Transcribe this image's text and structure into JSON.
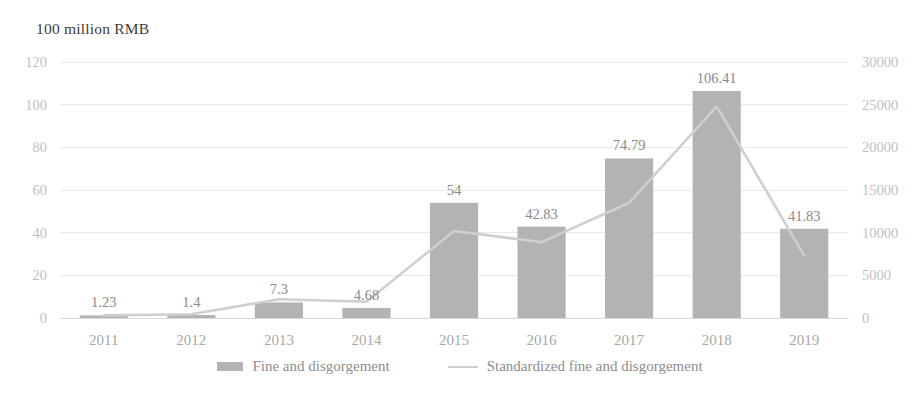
{
  "chart_data": {
    "type": "bar",
    "title": "",
    "ylabel": "100 million RMB",
    "xlabel": "",
    "categories": [
      "2011",
      "2012",
      "2013",
      "2014",
      "2015",
      "2016",
      "2017",
      "2018",
      "2019"
    ],
    "grid": true,
    "legend_position": "bottom",
    "ylim": [
      0,
      120
    ],
    "y2lim": [
      0,
      30000
    ],
    "yticks": [
      "0",
      "20",
      "40",
      "60",
      "80",
      "100",
      "120"
    ],
    "y2ticks": [
      "0",
      "5000",
      "10000",
      "15000",
      "20000",
      "25000",
      "30000"
    ],
    "series": [
      {
        "name": "Fine and disgorgement",
        "type": "bar",
        "axis": "left",
        "color": "#b3b3b3",
        "values": [
          1.23,
          1.4,
          7.3,
          4.68,
          54,
          42.83,
          74.79,
          106.41,
          41.83
        ],
        "data_labels": [
          "1.23",
          "1.4",
          "7.3",
          "4.68",
          "54",
          "42.83",
          "74.79",
          "106.41",
          "41.83"
        ]
      },
      {
        "name": "Standardized fine and disgorgement",
        "type": "line",
        "axis": "right",
        "color": "#cfcfcf",
        "values": [
          300,
          450,
          2200,
          1900,
          10200,
          8900,
          13500,
          24800,
          7300
        ]
      }
    ]
  },
  "axis_title": "100 million RMB",
  "legend": {
    "items": [
      {
        "label": "Fine and disgorgement",
        "marker": "bar-swatch",
        "color": "#b3b3b3"
      },
      {
        "label": "Standardized fine and disgorgement",
        "marker": "line-swatch",
        "color": "#cfcfcf"
      }
    ]
  }
}
